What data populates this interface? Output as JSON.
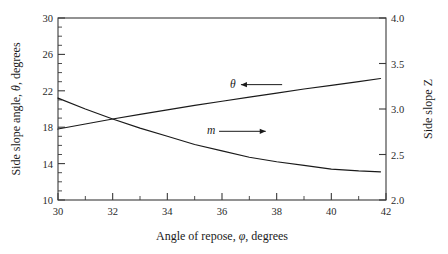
{
  "chart_data": {
    "type": "line",
    "title": "",
    "xlabel": "Angle of repose, φ, degrees",
    "ylabel": "Side slope angle, θ, degrees",
    "y2label": "Side slope Z",
    "xlim": [
      30,
      42
    ],
    "ylim": [
      10,
      30
    ],
    "y2lim": [
      2.0,
      4.0
    ],
    "grid": false,
    "legend": "none",
    "xticks": [
      30,
      32,
      34,
      36,
      38,
      40,
      42
    ],
    "xticklabels": [
      "30",
      "32",
      "34",
      "36",
      "38",
      "40",
      "42"
    ],
    "xminorticks": [
      31,
      33,
      35,
      37,
      39,
      41
    ],
    "yticks": [
      10,
      14,
      18,
      22,
      26,
      30
    ],
    "yticklabels": [
      "10",
      "14",
      "18",
      "22",
      "26",
      "30"
    ],
    "yminorticks": [
      11,
      12,
      13,
      15,
      16,
      17,
      19,
      20,
      21,
      23,
      24,
      25,
      27,
      28,
      29
    ],
    "y2ticks": [
      2.0,
      2.5,
      3.0,
      3.5,
      4.0
    ],
    "y2ticklabels": [
      "2.0",
      "2.5",
      "3.0",
      "3.5",
      "4.0"
    ],
    "series": [
      {
        "name": "θ",
        "axis": "left",
        "label": "θ",
        "arrow": "left",
        "x": [
          30,
          31,
          32,
          33,
          34,
          35,
          36,
          37,
          38,
          39,
          40,
          41,
          41.8
        ],
        "values": [
          17.8,
          18.35,
          18.9,
          19.4,
          19.9,
          20.4,
          20.85,
          21.3,
          21.75,
          22.2,
          22.6,
          23.0,
          23.35
        ]
      },
      {
        "name": "m",
        "axis": "right",
        "label": "m",
        "arrow": "right",
        "x": [
          30,
          31,
          32,
          33,
          34,
          35,
          36,
          37,
          38,
          39,
          40,
          41,
          41.8
        ],
        "values": [
          3.12,
          3.0,
          2.89,
          2.79,
          2.7,
          2.61,
          2.54,
          2.47,
          2.42,
          2.38,
          2.34,
          2.32,
          2.31
        ]
      }
    ],
    "annotations": [
      {
        "text": "θ",
        "x": 36.4,
        "y_axis": "left",
        "arrow_to_x": 38.2,
        "arrow_dir": "left"
      },
      {
        "text": "m",
        "x": 35.6,
        "y_axis": "right",
        "arrow_to_x": 37.6,
        "arrow_dir": "right"
      }
    ]
  },
  "axes": {
    "x_title_parts": {
      "pre": "Angle of repose, ",
      "sym": "φ",
      "post": ", degrees"
    },
    "y_title_parts": {
      "pre": "Side slope angle, ",
      "sym": "θ",
      "post": ", degrees"
    },
    "y2_title": "Side slope Z"
  },
  "colors": {
    "axis": "#3a3a3a",
    "curve": "#1a1a1a",
    "background": "#ffffff",
    "text": "#1a1a1a"
  }
}
